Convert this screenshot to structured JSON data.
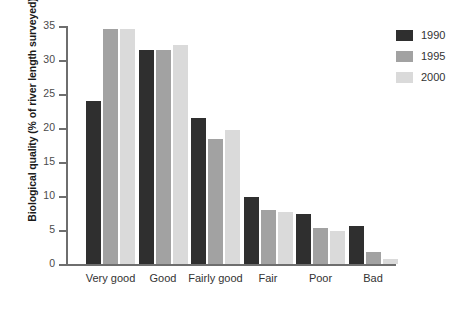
{
  "chart_data": {
    "type": "bar",
    "title": "",
    "xlabel": "",
    "ylabel": "Biological quality (% of river length surveyed)",
    "categories": [
      "Very good",
      "Good",
      "Fairly good",
      "Fair",
      "Poor",
      "Bad"
    ],
    "series": [
      {
        "name": "1990",
        "color": "#2f2f2f",
        "values": [
          24.0,
          31.5,
          21.5,
          9.8,
          7.3,
          5.6
        ]
      },
      {
        "name": "1995",
        "color": "#a2a2a2",
        "values": [
          34.6,
          31.5,
          18.4,
          8.0,
          5.3,
          1.8
        ]
      },
      {
        "name": "2000",
        "color": "#dadada",
        "values": [
          34.6,
          32.2,
          19.7,
          7.6,
          4.8,
          0.7
        ]
      }
    ],
    "ylim": [
      0,
      35
    ],
    "yticks": [
      0,
      5,
      10,
      15,
      20,
      25,
      30,
      35
    ],
    "ytick_labels": [
      "0",
      "5",
      "10",
      "15",
      "20",
      "25",
      "30",
      "35"
    ],
    "grid": false,
    "legend_position": "top-right",
    "legend_entries": [
      "1990",
      "1995",
      "2000"
    ]
  }
}
